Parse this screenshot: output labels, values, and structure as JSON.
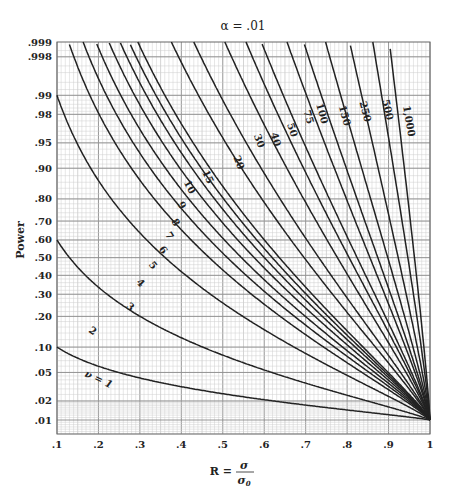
{
  "chart_data": {
    "type": "line",
    "title": "α = .01",
    "xlabel": "R = σ/σ0",
    "ylabel": "Power",
    "xlim": [
      0.1,
      1.0
    ],
    "ylim": [
      0.01,
      0.999
    ],
    "grid": true,
    "y_scale": "probability (normal-probit)",
    "x_ticks": [
      ".1",
      ".2",
      ".3",
      ".4",
      ".5",
      ".6",
      ".7",
      ".8",
      ".9",
      "1"
    ],
    "y_ticks": [
      ".999",
      ".998",
      ".99",
      ".98",
      ".95",
      ".90",
      ".80",
      ".70",
      ".60",
      ".50",
      ".40",
      ".30",
      ".20",
      ".10",
      ".05",
      ".02",
      ".01"
    ],
    "series_param": "ν (degrees of freedom)",
    "series": [
      {
        "name": "ν = 1",
        "label": "ν = 1",
        "top_x": null,
        "left_power": 0.1
      },
      {
        "name": "2",
        "label": "2",
        "top_x": null,
        "left_power": 0.6
      },
      {
        "name": "3",
        "label": "3",
        "top_x": null,
        "left_power": 0.99
      },
      {
        "name": "4",
        "label": "4",
        "top_x": 0.128
      },
      {
        "name": "5",
        "label": "5",
        "top_x": 0.163
      },
      {
        "name": "6",
        "label": "6",
        "top_x": 0.194
      },
      {
        "name": "7",
        "label": "7",
        "top_x": 0.225
      },
      {
        "name": "8",
        "label": "8",
        "top_x": 0.252
      },
      {
        "name": "9",
        "label": "9",
        "top_x": 0.274
      },
      {
        "name": "10",
        "label": "10",
        "top_x": 0.295
      },
      {
        "name": "15",
        "label": "15",
        "top_x": 0.376
      },
      {
        "name": "20",
        "label": "20",
        "top_x": 0.43
      },
      {
        "name": "30",
        "label": "30",
        "top_x": 0.505
      },
      {
        "name": "40",
        "label": "40",
        "top_x": 0.556
      },
      {
        "name": "50",
        "label": "50",
        "top_x": 0.593
      },
      {
        "name": "75",
        "label": "75",
        "top_x": 0.655
      },
      {
        "name": "100",
        "label": "100",
        "top_x": 0.695
      },
      {
        "name": "150",
        "label": "150",
        "top_x": 0.748
      },
      {
        "name": "250",
        "label": "250",
        "top_x": 0.806
      },
      {
        "name": "500",
        "label": "500",
        "top_x": 0.862
      },
      {
        "name": "1,000",
        "label": "1,000",
        "top_x": 0.902
      }
    ],
    "convergence_point": {
      "x": 1.0,
      "power": 0.01
    }
  }
}
